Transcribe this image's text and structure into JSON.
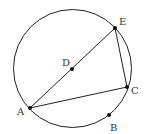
{
  "diagram": {
    "circle": {
      "cx": 72.5,
      "cy": 68.5,
      "r": 59
    },
    "points": [
      {
        "name": "A",
        "x": 30,
        "y": 108,
        "label_x": 17,
        "label_y": 115
      },
      {
        "name": "B",
        "x": 109,
        "y": 115,
        "label_x": 110,
        "label_y": 131
      },
      {
        "name": "C",
        "x": 127,
        "y": 87,
        "label_x": 131,
        "label_y": 94
      },
      {
        "name": "D",
        "x": 72,
        "y": 69,
        "label_x": 62,
        "label_y": 66
      },
      {
        "name": "E",
        "x": 115,
        "y": 28,
        "label_x": 119,
        "label_y": 25
      }
    ],
    "segments": [
      [
        "A",
        "E"
      ],
      [
        "E",
        "C"
      ],
      [
        "A",
        "C"
      ]
    ],
    "colors": {
      "stroke": "#222222",
      "label": "#333333"
    }
  }
}
